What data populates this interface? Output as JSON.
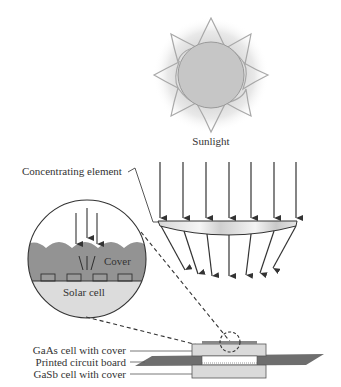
{
  "diagram": {
    "type": "concentrator-photovoltaic-schematic",
    "labels": {
      "sunlight": "Sunlight",
      "concentrating_element": "Concentrating element",
      "cover": "Cover",
      "solar_cell": "Solar cell",
      "gaas_cell": "GaAs cell with cover",
      "pcb": "Printed circuit board",
      "gasb_cell": "GaSb cell with cover"
    },
    "components": [
      {
        "id": "sun",
        "icon": "sun-icon"
      },
      {
        "id": "incoming-rays",
        "count": 7
      },
      {
        "id": "lens",
        "label_ref": "concentrating_element"
      },
      {
        "id": "focused-rays",
        "count": 7
      },
      {
        "id": "detail-magnifier",
        "contains": [
          "cover",
          "solar_cell"
        ]
      },
      {
        "id": "cell-stack",
        "layers": [
          "gaas_cell",
          "pcb",
          "gasb_cell"
        ]
      }
    ],
    "colors": {
      "sun_fill": "#c8c8c8",
      "sun_glow": "#e6e6e6",
      "ray": "#333333",
      "cover": "#8f8f8f",
      "solar_cell": "#d9d9d9",
      "pcb": "#6e6e6e",
      "cell_box": "#dadada"
    }
  }
}
